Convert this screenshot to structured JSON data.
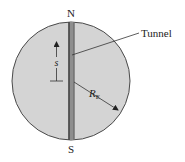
{
  "diagram": {
    "north_label": "N",
    "south_label": "S",
    "tunnel_label": "Tunnel",
    "displacement_label": "s",
    "radius_label": "R",
    "radius_subscript": "E",
    "colors": {
      "earth_fill": "#d4d4d4",
      "earth_stroke": "#4a4a4a",
      "tunnel_dark": "#5a5a5a",
      "tunnel_light": "#8e8e8e",
      "line": "#333333"
    }
  }
}
